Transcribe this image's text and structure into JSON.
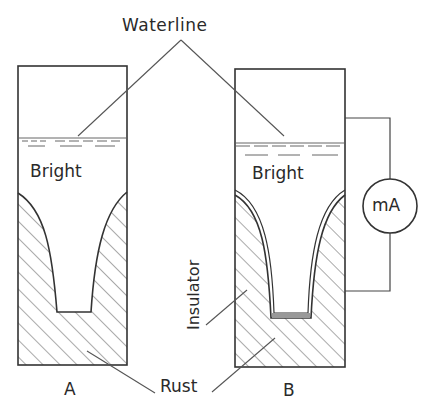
{
  "figure": {
    "type": "schematic",
    "labels": {
      "waterline": "Waterline",
      "bright_a": "Bright",
      "bright_b": "Bright",
      "ammeter": "mA",
      "insulator": "Insulator",
      "rust": "Rust",
      "container_a": "A",
      "container_b": "B"
    },
    "colors": {
      "line": "#333333",
      "hatch": "#555555",
      "background": "#ffffff"
    }
  }
}
